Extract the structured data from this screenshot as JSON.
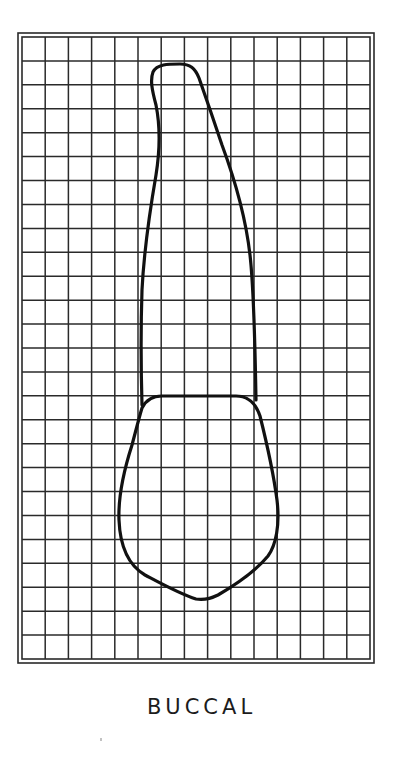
{
  "figure": {
    "type": "tooth-outline-on-grid",
    "view": "buccal",
    "caption": "BUCCAL",
    "grid": {
      "columns": 15,
      "rows": 26,
      "inner_left": 22,
      "inner_top": 37,
      "inner_right": 370,
      "inner_bottom": 659,
      "outer_left": 18,
      "outer_top": 33,
      "outer_right": 374,
      "outer_bottom": 663
    },
    "outline": {
      "parts": [
        "root",
        "crown",
        "cemento-enamel-junction"
      ]
    },
    "colors": {
      "ink": "#111111",
      "grid": "#2a2a2a",
      "background": "#ffffff"
    }
  }
}
